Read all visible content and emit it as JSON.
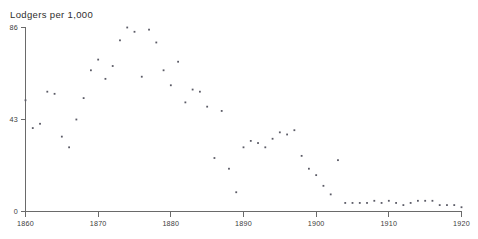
{
  "chart_data": {
    "type": "scatter",
    "title": "Lodgers per 1,000",
    "xlabel": "",
    "ylabel": "Lodgers per 1,000",
    "xlim": [
      1859,
      1920
    ],
    "ylim": [
      0,
      86
    ],
    "grid": false,
    "legend": null,
    "y_ticks": [
      0,
      43,
      86
    ],
    "y_tick_labels": [
      "0",
      "43",
      "86"
    ],
    "x_ticks": [
      1860,
      1870,
      1880,
      1890,
      1900,
      1910,
      1920
    ],
    "x_tick_labels": [
      "1860",
      "1870",
      "1880",
      "1890",
      "1900",
      "1910",
      "1920"
    ],
    "marker": "dot",
    "marker_color": "#5b5b66",
    "series": [
      {
        "name": "Lodgers per 1,000",
        "x": [
          1860,
          1861,
          1862,
          1863,
          1864,
          1865,
          1866,
          1867,
          1868,
          1869,
          1870,
          1871,
          1872,
          1873,
          1874,
          1875,
          1876,
          1877,
          1878,
          1879,
          1880,
          1881,
          1882,
          1883,
          1884,
          1885,
          1886,
          1887,
          1888,
          1889,
          1890,
          1891,
          1892,
          1893,
          1894,
          1895,
          1896,
          1897,
          1898,
          1899,
          1900,
          1901,
          1902,
          1903,
          1904,
          1905,
          1906,
          1907,
          1908,
          1909,
          1910,
          1911,
          1912,
          1913,
          1914,
          1915,
          1916,
          1917,
          1918,
          1919,
          1920
        ],
        "values": [
          52,
          39,
          41,
          56,
          55,
          35,
          30,
          43,
          53,
          66,
          71,
          62,
          68,
          80,
          86,
          84,
          63,
          85,
          79,
          66,
          59,
          70,
          51,
          57,
          56,
          49,
          25,
          47,
          20,
          9,
          30,
          33,
          32,
          30,
          34,
          37,
          36,
          38,
          26,
          20,
          17,
          12,
          8,
          24,
          4,
          4,
          4,
          4,
          5,
          4,
          5,
          4,
          3,
          4,
          5,
          5,
          5,
          3,
          3,
          3,
          2
        ]
      }
    ]
  },
  "caption": ""
}
